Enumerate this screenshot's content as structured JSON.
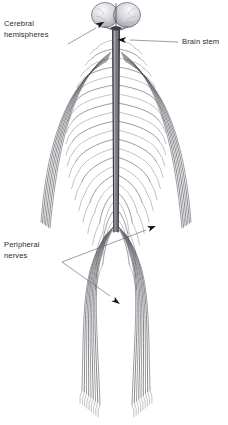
{
  "figure": {
    "background_color": "#ffffff",
    "ink_color": "#2b2b2b",
    "width": 228,
    "height": 425
  },
  "labels": [
    {
      "id": "cerebral-hemispheres",
      "line1": "Cerebral",
      "line2": "hemispheres",
      "x": 4,
      "y": 26,
      "anchor": "start",
      "leader": "M 68 44 L 96 28",
      "arrow_at": [
        97,
        26
      ],
      "arrow_angle": -30
    },
    {
      "id": "brain-stem",
      "line1": "Brain stem",
      "line2": "",
      "x": 182,
      "y": 44,
      "anchor": "start",
      "leader": "M 178 42 L 130 40",
      "arrow_at": [
        126,
        40
      ],
      "arrow_angle": 182
    },
    {
      "id": "peripheral-nerves",
      "line1": "Peripheral",
      "line2": "nerves",
      "x": 4,
      "y": 247,
      "anchor": "start",
      "leader": "M 62 262 L 146 230",
      "arrow_at": [
        148,
        229
      ],
      "arrow_angle": -21
    },
    {
      "id": "peripheral-nerves-lower",
      "line1": "",
      "line2": "",
      "x": 0,
      "y": 0,
      "anchor": "start",
      "leader": "M 62 262 L 110 296",
      "arrow_at": [
        113,
        299
      ],
      "arrow_angle": 36
    }
  ],
  "anatomy": {
    "brain": {
      "name": "cerebral hemispheres",
      "cx": 116,
      "cy": 15,
      "rx": 24,
      "ry": 13,
      "fill_light": "#e9e9ec",
      "fill_mid": "#c9c9cf",
      "fill_dark": "#9a9aa3",
      "midline_color": "#44444c"
    },
    "spinal_cord": {
      "name": "spinal cord",
      "top_y": 30,
      "bottom_y": 232,
      "center_x": 116,
      "half_width_top": 3.4,
      "half_width_bottom": 2.2,
      "fill": "#9a9aa2",
      "edge": "#3a3a42"
    },
    "nerve_roots": {
      "name": "spinal nerve roots",
      "count_per_side": 22,
      "start_y": 40,
      "end_y": 230,
      "color": "#4a4a52"
    },
    "arms": {
      "name": "upper limb nerves",
      "strands_per_side": 7,
      "top_y": 52,
      "bottom_y": 228,
      "color": "#53535c"
    },
    "legs": {
      "name": "lower limb nerves",
      "strands_per_side": 9,
      "top_y": 232,
      "bottom_y": 404,
      "color": "#53535c"
    }
  }
}
